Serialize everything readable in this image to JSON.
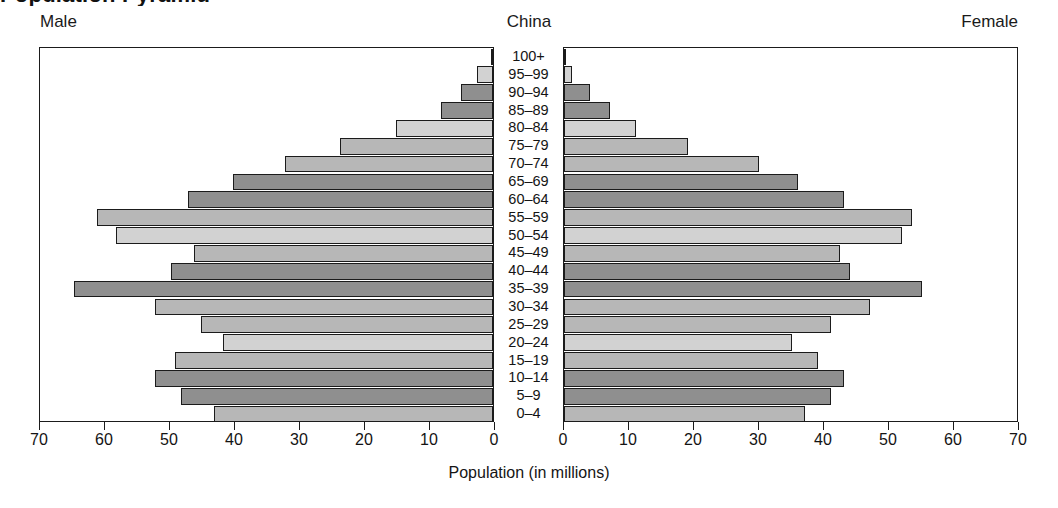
{
  "title_sliver": "Population Pyramid",
  "header": {
    "male_label": "Male",
    "country_label": "China",
    "female_label": "Female"
  },
  "axis": {
    "title": "Population (in millions)",
    "male_ticks": [
      70,
      60,
      50,
      40,
      30,
      20,
      10,
      0
    ],
    "female_ticks": [
      0,
      10,
      20,
      30,
      40,
      50,
      60,
      70
    ],
    "max": 70
  },
  "colors": {
    "frame": "#1b1b1b",
    "tone_a": "#b7b7b7",
    "tone_b": "#8f8f8f",
    "tone_c": "#d2d2d2",
    "background": "#ffffff"
  },
  "chart_data": {
    "type": "bar",
    "subtype": "population-pyramid",
    "title": "China",
    "xlabel": "Population (in millions)",
    "ylabel": "",
    "xlim": [
      -70,
      70
    ],
    "grid": false,
    "legend": [
      "Male",
      "Female"
    ],
    "legend_position": "top-left-and-top-right",
    "categories": [
      "100+",
      "95–99",
      "90–94",
      "85–89",
      "80–84",
      "75–79",
      "70–74",
      "65–69",
      "60–64",
      "55–59",
      "50–54",
      "45–49",
      "40–44",
      "35–39",
      "30–34",
      "25–29",
      "20–24",
      "15–19",
      "10–14",
      "5–9",
      "0–4"
    ],
    "series": [
      {
        "name": "Male",
        "side": "left",
        "values": [
          0.3,
          2.5,
          5.0,
          8.0,
          15.0,
          23.5,
          32.0,
          40.0,
          47.0,
          61.0,
          58.0,
          46.0,
          49.5,
          64.5,
          52.0,
          45.0,
          41.5,
          49.0,
          52.0,
          48.0,
          43.0
        ]
      },
      {
        "name": "Female",
        "side": "right",
        "values": [
          0.3,
          1.2,
          4.0,
          7.0,
          11.0,
          19.0,
          30.0,
          36.0,
          43.0,
          53.5,
          52.0,
          42.5,
          44.0,
          55.0,
          47.0,
          41.0,
          35.0,
          39.0,
          43.0,
          41.0,
          37.0
        ]
      }
    ],
    "bar_tones": [
      "tone-c",
      "tone-c",
      "tone-b",
      "tone-b",
      "tone-c",
      "tone-a",
      "tone-a",
      "tone-b",
      "tone-b",
      "tone-a",
      "tone-c",
      "tone-a",
      "tone-b",
      "tone-b",
      "tone-a",
      "tone-a",
      "tone-c",
      "tone-a",
      "tone-b",
      "tone-b",
      "tone-a"
    ]
  }
}
